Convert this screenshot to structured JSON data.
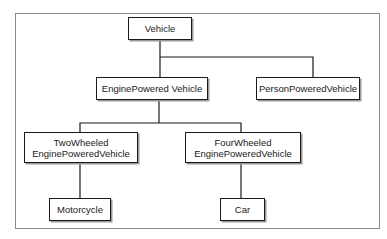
{
  "diagram": {
    "type": "hierarchy",
    "nodes": {
      "vehicle": {
        "label": "Vehicle"
      },
      "engine_powered": {
        "label": "EnginePowered Vehicle"
      },
      "person_powered": {
        "label": "PersonPoweredVehicle"
      },
      "two_wheeled": {
        "line1": "TwoWheeled",
        "line2": "EnginePoweredVehicle"
      },
      "four_wheeled": {
        "line1": "FourWheeled",
        "line2": "EnginePoweredVehicle"
      },
      "motorcycle": {
        "label": "Motorcycle"
      },
      "car": {
        "label": "Car"
      }
    },
    "edges": [
      {
        "from": "Vehicle",
        "to": "EnginePowered Vehicle"
      },
      {
        "from": "Vehicle",
        "to": "PersonPoweredVehicle"
      },
      {
        "from": "EnginePowered Vehicle",
        "to": "TwoWheeled EnginePoweredVehicle"
      },
      {
        "from": "EnginePowered Vehicle",
        "to": "FourWheeled EnginePoweredVehicle"
      },
      {
        "from": "TwoWheeled EnginePoweredVehicle",
        "to": "Motorcycle"
      },
      {
        "from": "FourWheeled EnginePoweredVehicle",
        "to": "Car"
      }
    ],
    "colors": {
      "stroke": "#1a1a1a",
      "frame": "#8a8a8a",
      "shadow": "#9a9a9a",
      "background": "#ffffff"
    }
  }
}
